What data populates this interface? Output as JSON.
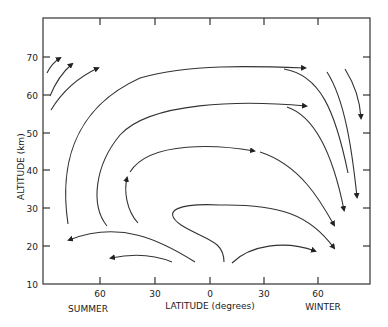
{
  "figure": {
    "type": "meridional circulation streamlines",
    "xlabel": "LATITUDE (degrees)",
    "ylabel": "ALTITUDE (km)",
    "x_ticks": [
      "60",
      "30",
      "0",
      "30",
      "60"
    ],
    "y_ticks": [
      "10",
      "20",
      "30",
      "40",
      "50",
      "60",
      "70"
    ],
    "left_hemisphere_label": "SUMMER",
    "right_hemisphere_label": "WINTER",
    "colors": {
      "ink": "#222222",
      "background": "#ffffff"
    }
  }
}
